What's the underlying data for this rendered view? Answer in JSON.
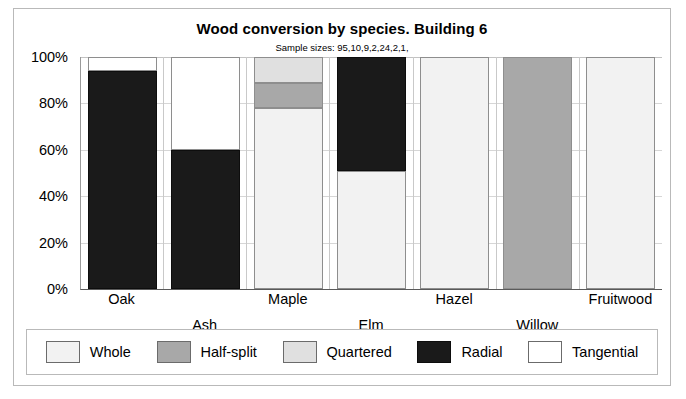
{
  "chart_data": {
    "type": "bar",
    "stacked": true,
    "title": "Wood conversion by species. Building 6",
    "subtitle": "Sample sizes: 95,10,9,2,24,2,1,",
    "xlabel": "",
    "ylabel": "",
    "ylim": [
      0,
      100
    ],
    "yticks": [
      "0%",
      "20%",
      "40%",
      "60%",
      "80%",
      "100%"
    ],
    "ytick_values": [
      0,
      20,
      40,
      60,
      80,
      100
    ],
    "grid": true,
    "legend_position": "bottom",
    "categories": [
      "Oak",
      "Ash",
      "Maple",
      "Elm",
      "Hazel",
      "Willow",
      "Fruitwood"
    ],
    "sample_sizes": [
      95,
      10,
      9,
      2,
      24,
      2,
      1
    ],
    "series": [
      {
        "name": "Whole",
        "color": "#f2f2f2",
        "values": [
          0,
          0,
          78,
          51,
          100,
          0,
          100
        ]
      },
      {
        "name": "Half-split",
        "color": "#a8a8a8",
        "values": [
          0,
          0,
          11,
          0,
          0,
          100,
          0
        ]
      },
      {
        "name": "Quartered",
        "color": "#e0e0e0",
        "values": [
          0,
          0,
          11,
          0,
          0,
          0,
          0
        ]
      },
      {
        "name": "Radial",
        "color": "#1a1a1a",
        "values": [
          94,
          60,
          0,
          49,
          0,
          0,
          0
        ]
      },
      {
        "name": "Tangential",
        "color": "#ffffff",
        "values": [
          6,
          40,
          0,
          0,
          0,
          0,
          0
        ]
      }
    ]
  },
  "legend": {
    "items": [
      {
        "label": "Whole"
      },
      {
        "label": "Half-split"
      },
      {
        "label": "Quartered"
      },
      {
        "label": "Radial"
      },
      {
        "label": "Tangential"
      }
    ]
  }
}
